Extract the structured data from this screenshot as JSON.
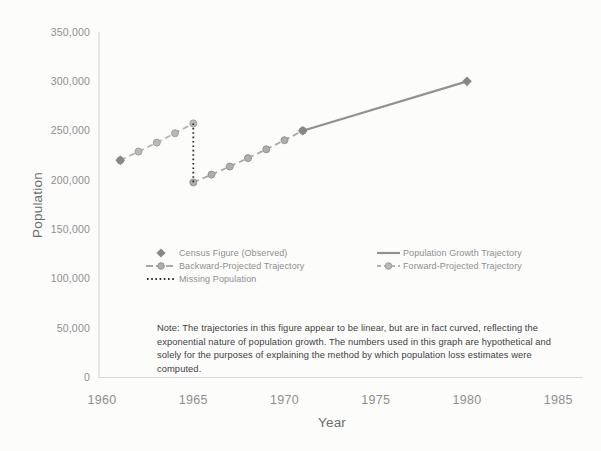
{
  "axes": {
    "y_title": "Population",
    "x_title": "Year",
    "x_range": [
      1960,
      1985
    ],
    "y_range": [
      0,
      350000
    ],
    "y_ticks": [
      {
        "value": 0,
        "label": "0"
      },
      {
        "value": 50000,
        "label": "50,000"
      },
      {
        "value": 100000,
        "label": "100,000"
      },
      {
        "value": 150000,
        "label": "150,000"
      },
      {
        "value": 200000,
        "label": "200,000"
      },
      {
        "value": 250000,
        "label": "250,000"
      },
      {
        "value": 300000,
        "label": "300,000"
      },
      {
        "value": 350000,
        "label": "350,000"
      }
    ],
    "x_ticks": [
      {
        "value": 1960,
        "label": "1960"
      },
      {
        "value": 1965,
        "label": "1965"
      },
      {
        "value": 1970,
        "label": "1970"
      },
      {
        "value": 1975,
        "label": "1975"
      },
      {
        "value": 1980,
        "label": "1980"
      },
      {
        "value": 1985,
        "label": "1985"
      }
    ]
  },
  "legend": {
    "census": "Census Figure (Observed)",
    "backward": "Backward-Projected Trajectory",
    "missing": "Missing Population",
    "growth": "Population Growth Trajectory",
    "forward": "Forward-Projected Trajectory"
  },
  "note": {
    "text": "Note: The trajectories in this figure appear to be linear, but are in fact curved, reflecting the exponential nature of population growth. The numbers used in this graph are hypothetical and solely for the purposes of explaining the method by which population loss estimates were computed."
  },
  "colors": {
    "background": "#fcfcfb",
    "axis_line": "#d8d8d8",
    "tick_text": "#8f8f8f",
    "axis_title_text": "#6d6d6d",
    "legend_text": "#8f8f8f",
    "note_text": "#3e3e3e",
    "census_diamond": "#878787",
    "growth_line": "#919191",
    "backward_line": "#a8a8a8",
    "forward_line": "#b5b5b5",
    "missing_dotted": "#2d2d2d"
  },
  "chart_data": {
    "type": "line",
    "title": "",
    "xlabel": "Year",
    "ylabel": "Population",
    "xlim": [
      1960,
      1985
    ],
    "ylim": [
      0,
      350000
    ],
    "grid": false,
    "legend_position": "inside lower-left, two columns",
    "series": [
      {
        "id": "forward",
        "name": "Forward-Projected Trajectory",
        "line": "dashed",
        "marker": "circle",
        "color": "#b5b5b5",
        "marker_fill": "#b9b9b9",
        "marker_stroke": "#9f9f9f",
        "points": [
          [
            1961,
            220000
          ],
          [
            1962,
            228800
          ],
          [
            1963,
            238000
          ],
          [
            1964,
            247500
          ],
          [
            1965,
            257400
          ]
        ]
      },
      {
        "id": "backward",
        "name": "Backward-Projected Trajectory",
        "line": "dashed",
        "marker": "circle",
        "color": "#a8a8a8",
        "marker_fill": "#aeaeae",
        "marker_stroke": "#939393",
        "points": [
          [
            1965,
            197600
          ],
          [
            1966,
            205500
          ],
          [
            1967,
            213700
          ],
          [
            1968,
            222300
          ],
          [
            1969,
            231200
          ],
          [
            1970,
            240400
          ],
          [
            1971,
            250000
          ]
        ]
      },
      {
        "id": "missing",
        "name": "Missing Population",
        "line": "dotted",
        "marker": "none",
        "color": "#2d2d2d",
        "points": [
          [
            1965,
            257400
          ],
          [
            1965,
            197600
          ]
        ]
      },
      {
        "id": "growth",
        "name": "Population Growth Trajectory",
        "line": "solid",
        "marker": "none",
        "color": "#919191",
        "points": [
          [
            1971,
            250000
          ],
          [
            1980,
            300000
          ]
        ]
      },
      {
        "id": "census",
        "name": "Census Figure (Observed)",
        "line": "none",
        "marker": "diamond",
        "color": "#878787",
        "points": [
          [
            1961,
            220000
          ],
          [
            1971,
            250000
          ],
          [
            1980,
            300000
          ]
        ]
      }
    ]
  }
}
